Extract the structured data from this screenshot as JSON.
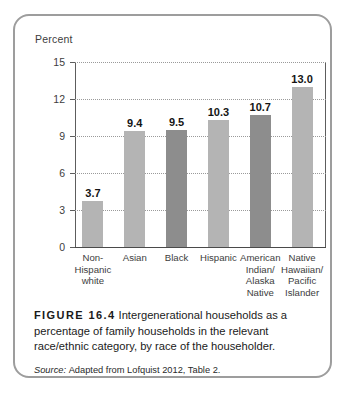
{
  "figure": {
    "number_label": "FIGURE 16.4",
    "caption": "Intergenerational households as a percentage of family households in the relevant race/ethnic category, by race of the householder.",
    "source_label": "Source:",
    "source_text": "Adapted from Lofquist 2012, Table 2."
  },
  "chart_data": {
    "type": "bar",
    "title": "",
    "xlabel": "",
    "ylabel": "Percent",
    "ylim": [
      0,
      15
    ],
    "yticks": [
      0,
      3,
      6,
      9,
      12,
      15
    ],
    "ytick_labels": [
      "0",
      "3",
      "6",
      "9",
      "12",
      "15"
    ],
    "grid": true,
    "grid_style": "dotted-horizontal",
    "legend": "none",
    "categories": [
      "Non-\nHispanic\nwhite",
      "Asian",
      "Black",
      "Hispanic",
      "American\nIndian/\nAlaska\nNative",
      "Native\nHawaiian/\nPacific\nIslander"
    ],
    "values": [
      3.7,
      9.4,
      9.5,
      10.3,
      10.7,
      13.0
    ],
    "value_labels": [
      "3.7",
      "9.4",
      "9.5",
      "10.3",
      "10.7",
      "13.0"
    ],
    "bar_colors": [
      "#b4b4b4",
      "#b4b4b4",
      "#8d8d8d",
      "#b4b4b4",
      "#8d8d8d",
      "#b4b4b4"
    ],
    "colors": {
      "bar_light": "#b4b4b4",
      "bar_dark": "#8d8d8d",
      "gridline": "#9a9a9a",
      "axis": "#5d5d5d",
      "frame": "#9d9d9d",
      "text": "#231f20"
    }
  }
}
